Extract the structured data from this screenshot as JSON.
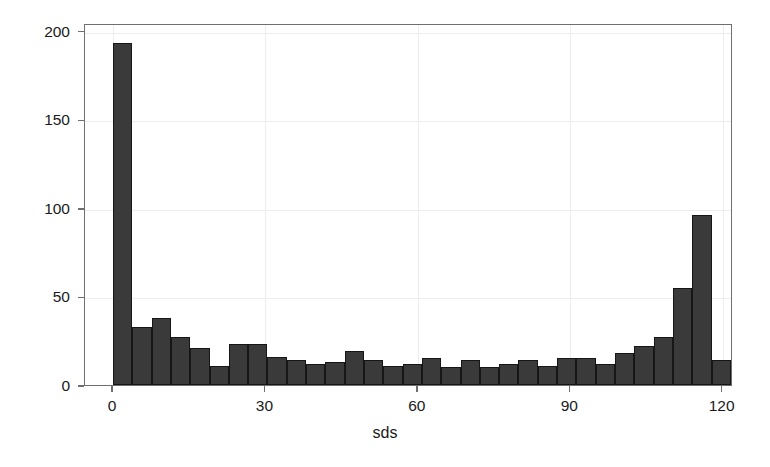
{
  "chart_data": {
    "type": "bar",
    "title": "",
    "subtitle": "",
    "xlabel": "sds",
    "ylabel": "",
    "xlim": [
      -2,
      122
    ],
    "ylim": [
      0,
      206
    ],
    "grid": true,
    "legend": null,
    "xticks": [
      0,
      30,
      60,
      90,
      120
    ],
    "xtick_labels": [
      "0",
      "30",
      "60",
      "90",
      "120"
    ],
    "yticks": [
      0,
      50,
      100,
      150,
      200
    ],
    "ytick_labels": [
      "0",
      "50",
      "100",
      "150",
      "200"
    ],
    "bin_width": 3.8,
    "bin_starts": [
      0,
      3.8,
      7.6,
      11.4,
      15.2,
      19,
      22.8,
      26.6,
      30.4,
      34.2,
      38,
      41.8,
      45.6,
      49.4,
      53.2,
      57,
      60.8,
      64.6,
      68.4,
      72.2,
      76,
      79.8,
      83.6,
      87.4,
      91.2,
      95,
      98.8,
      102.6,
      106.4,
      110.2,
      114
    ],
    "values": [
      193,
      33,
      38,
      27,
      21,
      11,
      23,
      23,
      16,
      14,
      12,
      13,
      19,
      14,
      11,
      12,
      15,
      10,
      14,
      10,
      12,
      14,
      11,
      15,
      15,
      12,
      18,
      22,
      27,
      55,
      96,
      14
    ],
    "bar_color": "#3a3a3a",
    "bar_edge_color": "#161616",
    "axis_color": "#6f6f6f",
    "grid_color": "#ededed",
    "background_color": "#ffffff"
  }
}
